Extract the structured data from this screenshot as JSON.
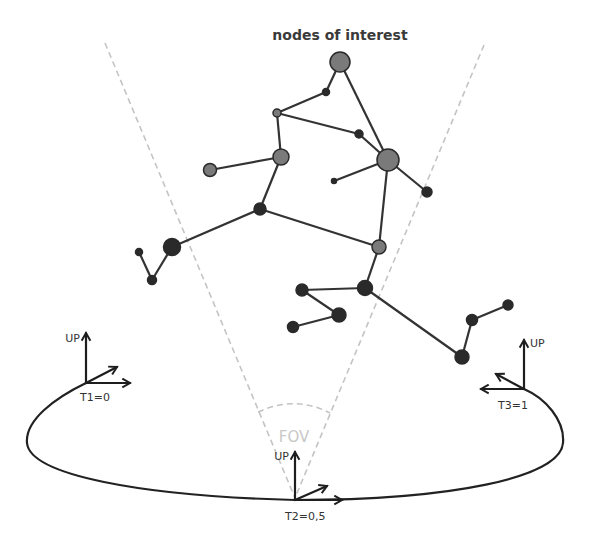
{
  "diagram": {
    "title": "nodes of interest",
    "fov_label": "FOV",
    "colors": {
      "node_gray": "#7a7a7a",
      "node_dark": "#2a2a2a",
      "edge": "#333333",
      "fov_dashed": "#c4c4c4",
      "curve": "#222222"
    },
    "nodes": [
      {
        "id": "n1",
        "x": 340,
        "y": 62,
        "r": 10,
        "tone": "gray"
      },
      {
        "id": "n2",
        "x": 326,
        "y": 92,
        "r": 3.5,
        "tone": "dark"
      },
      {
        "id": "n3",
        "x": 277,
        "y": 113,
        "r": 4,
        "tone": "gray"
      },
      {
        "id": "n4",
        "x": 359,
        "y": 134,
        "r": 4,
        "tone": "dark"
      },
      {
        "id": "n5",
        "x": 388,
        "y": 160,
        "r": 11,
        "tone": "gray"
      },
      {
        "id": "n6",
        "x": 334,
        "y": 181,
        "r": 2.5,
        "tone": "dark"
      },
      {
        "id": "n7",
        "x": 427,
        "y": 192,
        "r": 5,
        "tone": "dark"
      },
      {
        "id": "n8",
        "x": 281,
        "y": 157,
        "r": 8,
        "tone": "gray"
      },
      {
        "id": "n9",
        "x": 210,
        "y": 170,
        "r": 6.5,
        "tone": "gray"
      },
      {
        "id": "n10",
        "x": 260,
        "y": 209,
        "r": 6,
        "tone": "dark"
      },
      {
        "id": "n11",
        "x": 379,
        "y": 247,
        "r": 7,
        "tone": "gray"
      },
      {
        "id": "n12",
        "x": 172,
        "y": 247,
        "r": 8.5,
        "tone": "dark"
      },
      {
        "id": "n13",
        "x": 139,
        "y": 252,
        "r": 3.5,
        "tone": "dark"
      },
      {
        "id": "n14",
        "x": 152,
        "y": 280,
        "r": 4.5,
        "tone": "dark"
      },
      {
        "id": "n15",
        "x": 365,
        "y": 288,
        "r": 7.5,
        "tone": "dark"
      },
      {
        "id": "n16",
        "x": 302,
        "y": 290,
        "r": 6,
        "tone": "dark"
      },
      {
        "id": "n17",
        "x": 339,
        "y": 315,
        "r": 7,
        "tone": "dark"
      },
      {
        "id": "n18",
        "x": 293,
        "y": 327,
        "r": 5.5,
        "tone": "dark"
      },
      {
        "id": "n19",
        "x": 462,
        "y": 357,
        "r": 7,
        "tone": "dark"
      },
      {
        "id": "n20",
        "x": 472,
        "y": 320,
        "r": 5.5,
        "tone": "dark"
      },
      {
        "id": "n21",
        "x": 508,
        "y": 305,
        "r": 5,
        "tone": "dark"
      }
    ],
    "edges": [
      [
        "n1",
        "n2"
      ],
      [
        "n2",
        "n3"
      ],
      [
        "n1",
        "n5"
      ],
      [
        "n3",
        "n4"
      ],
      [
        "n4",
        "n5"
      ],
      [
        "n3",
        "n8"
      ],
      [
        "n5",
        "n6"
      ],
      [
        "n5",
        "n7"
      ],
      [
        "n5",
        "n11"
      ],
      [
        "n8",
        "n9"
      ],
      [
        "n8",
        "n10"
      ],
      [
        "n10",
        "n11"
      ],
      [
        "n10",
        "n12"
      ],
      [
        "n12",
        "n14"
      ],
      [
        "n14",
        "n13"
      ],
      [
        "n11",
        "n15"
      ],
      [
        "n15",
        "n16"
      ],
      [
        "n16",
        "n17"
      ],
      [
        "n17",
        "n18"
      ],
      [
        "n15",
        "n19"
      ],
      [
        "n19",
        "n20"
      ],
      [
        "n20",
        "n21"
      ]
    ],
    "camera_frames": [
      {
        "id": "t1",
        "label": "T1=0",
        "up_label": "UP",
        "x": 86,
        "y": 383
      },
      {
        "id": "t2",
        "label": "T2=0,5",
        "up_label": "UP",
        "x": 295,
        "y": 500
      },
      {
        "id": "t3",
        "label": "T3=1",
        "up_label": "UP",
        "x": 524,
        "y": 389
      }
    ]
  }
}
